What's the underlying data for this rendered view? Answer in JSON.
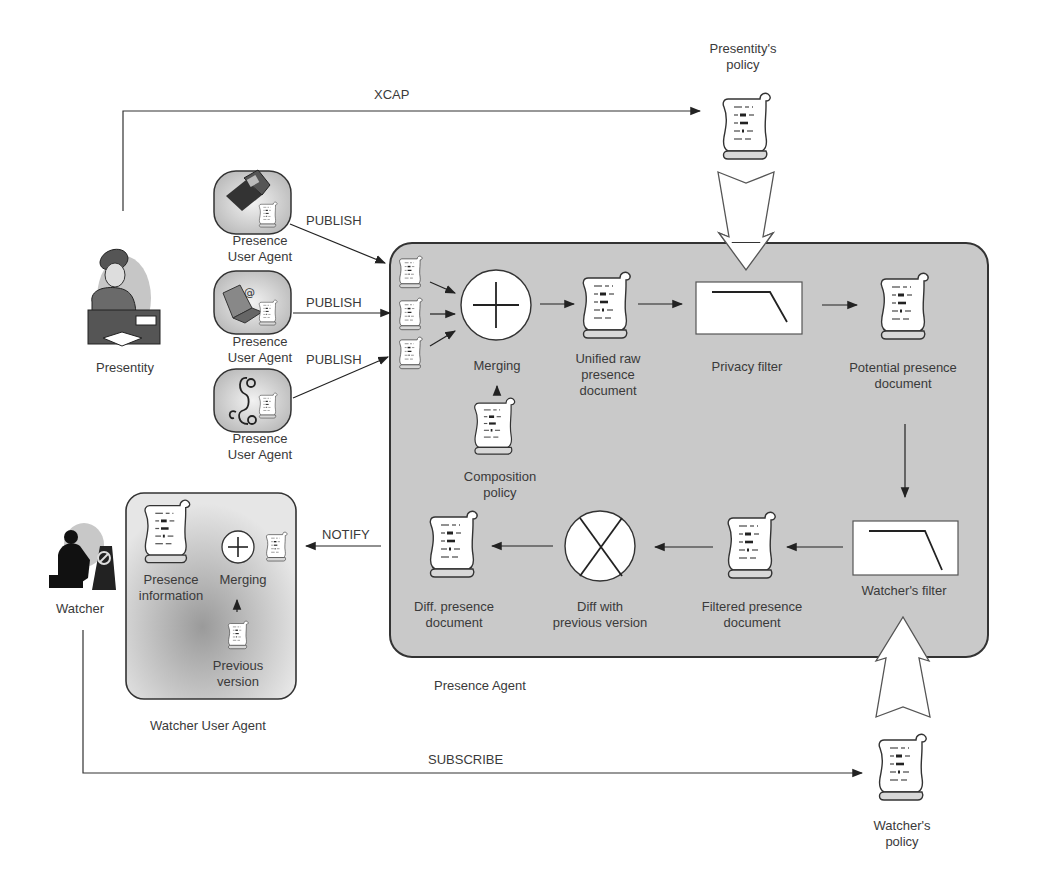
{
  "actors": {
    "presentity": {
      "label": "Presentity"
    },
    "watcher": {
      "label": "Watcher"
    }
  },
  "presence_user_agents": [
    {
      "label_line1": "Presence",
      "label_line2": "User Agent",
      "device": "laptop-icon"
    },
    {
      "label_line1": "Presence",
      "label_line2": "User Agent",
      "device": "email-computer-icon"
    },
    {
      "label_line1": "Presence",
      "label_line2": "User Agent",
      "device": "telephone-icon"
    }
  ],
  "messages": {
    "xcap": "XCAP",
    "publish": [
      "PUBLISH",
      "PUBLISH",
      "PUBLISH"
    ],
    "notify": "NOTIFY",
    "subscribe": "SUBSCRIBE"
  },
  "policies": {
    "presentity_policy": {
      "line1": "Presentity's",
      "line2": "policy"
    },
    "watcher_policy": {
      "line1": "Watcher's",
      "line2": "policy"
    }
  },
  "presence_agent": {
    "title": "Presence Agent",
    "nodes": {
      "merging": {
        "label": "Merging"
      },
      "composition_policy": {
        "line1": "Composition",
        "line2": "policy"
      },
      "unified_raw": {
        "line1": "Unified raw",
        "line2": "presence",
        "line3": "document"
      },
      "privacy_filter": {
        "label": "Privacy filter"
      },
      "potential": {
        "line1": "Potential presence",
        "line2": "document"
      },
      "watchers_filter": {
        "label": "Watcher's filter"
      },
      "filtered": {
        "line1": "Filtered presence",
        "line2": "document"
      },
      "diff": {
        "line1": "Diff with",
        "line2": "previous version"
      },
      "diff_doc": {
        "line1": "Diff. presence",
        "line2": "document"
      }
    }
  },
  "watcher_user_agent": {
    "title": "Watcher User Agent",
    "presence_information": {
      "line1": "Presence",
      "line2": "information"
    },
    "merging": {
      "label": "Merging"
    },
    "previous_version": {
      "line1": "Previous",
      "line2": "version"
    }
  },
  "colors": {
    "agent_box_fill": "#c9c9c9",
    "line": "#2a2a2a",
    "document_fill": "#ffffff"
  }
}
